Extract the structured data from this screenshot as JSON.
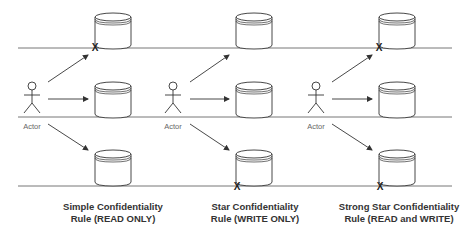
{
  "panels": [
    {
      "actor_label": "Actor",
      "caption_line1": "Simple Confidentiality",
      "caption_line2": "Rule (READ ONLY)",
      "blocked": [
        "top"
      ]
    },
    {
      "actor_label": "Actor",
      "caption_line1": "Star Confidentiality",
      "caption_line2": "Rule (WRITE ONLY)",
      "blocked": [
        "bottom"
      ]
    },
    {
      "actor_label": "Actor",
      "caption_line1": "Strong Star Confidentiality",
      "caption_line2": "Rule (READ and WRITE)",
      "blocked": [
        "top",
        "bottom"
      ]
    }
  ],
  "block_marker": "X",
  "colors": {
    "stroke": "#333333",
    "line": "#555555",
    "text": "#333333"
  }
}
